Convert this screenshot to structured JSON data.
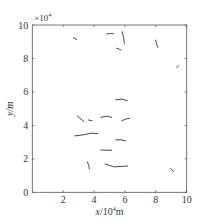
{
  "chart_data": {
    "type": "line",
    "title": "",
    "xlabel": "x/10^4m",
    "xlabel_parts": {
      "var": "x",
      "unit_prefix": "/10",
      "exp": "4",
      "unit": "m"
    },
    "ylabel": "y/m",
    "y_multiplier_label": "×10",
    "y_multiplier_exp": "4",
    "xlim": [
      0,
      10
    ],
    "ylim": [
      0,
      10
    ],
    "x_ticks": [
      2,
      4,
      6,
      8,
      10
    ],
    "x_tick_labels": [
      "2",
      "4",
      "6",
      "8",
      "10"
    ],
    "y_ticks": [
      0,
      2,
      4,
      6,
      8,
      10
    ],
    "y_tick_labels": [
      "0",
      "2",
      "4",
      "6",
      "8",
      "10"
    ],
    "grid": false,
    "legend": null,
    "series_color": "#333333",
    "series": [
      {
        "name": "track-1",
        "x": [
          2.66,
          2.87
        ],
        "y": [
          9.24,
          9.14
        ]
      },
      {
        "name": "track-2",
        "x": [
          4.81,
          5.05,
          5.25
        ],
        "y": [
          9.46,
          9.49,
          9.48
        ]
      },
      {
        "name": "track-3",
        "x": [
          5.81,
          5.92,
          5.96
        ],
        "y": [
          9.6,
          9.25,
          8.9
        ]
      },
      {
        "name": "track-4",
        "x": [
          5.46,
          5.75
        ],
        "y": [
          8.61,
          8.51
        ]
      },
      {
        "name": "track-5",
        "x": [
          7.99,
          8.05,
          8.12
        ],
        "y": [
          9.1,
          8.85,
          8.67
        ]
      },
      {
        "name": "track-6",
        "x": [
          9.35,
          9.48
        ],
        "y": [
          7.45,
          7.57
        ]
      },
      {
        "name": "track-7",
        "x": [
          5.4,
          5.8,
          6.16
        ],
        "y": [
          5.53,
          5.57,
          5.47
        ]
      },
      {
        "name": "track-8",
        "x": [
          2.92,
          3.35
        ],
        "y": [
          4.56,
          4.22
        ]
      },
      {
        "name": "track-9",
        "x": [
          3.63,
          3.87
        ],
        "y": [
          4.32,
          4.28
        ]
      },
      {
        "name": "track-10",
        "x": [
          4.45,
          4.8,
          5.14
        ],
        "y": [
          4.48,
          4.55,
          4.48
        ]
      },
      {
        "name": "track-11",
        "x": [
          5.81,
          6.05,
          6.29
        ],
        "y": [
          4.28,
          4.38,
          4.42
        ]
      },
      {
        "name": "track-12",
        "x": [
          2.76,
          3.4,
          3.8,
          4.23
        ],
        "y": [
          3.37,
          3.45,
          3.53,
          3.51
        ]
      },
      {
        "name": "track-13",
        "x": [
          5.4,
          5.75,
          6.05
        ],
        "y": [
          3.13,
          3.14,
          3.07
        ]
      },
      {
        "name": "track-14",
        "x": [
          4.45,
          5.14
        ],
        "y": [
          2.53,
          2.51
        ]
      },
      {
        "name": "track-15",
        "x": [
          3.56,
          3.66,
          3.69
        ],
        "y": [
          1.83,
          1.6,
          1.39
        ]
      },
      {
        "name": "track-16",
        "x": [
          4.71,
          5.3,
          5.8,
          6.18
        ],
        "y": [
          1.69,
          1.52,
          1.55,
          1.57
        ]
      },
      {
        "name": "track-17",
        "x": [
          8.96,
          9.16
        ],
        "y": [
          1.43,
          1.24
        ]
      }
    ]
  }
}
